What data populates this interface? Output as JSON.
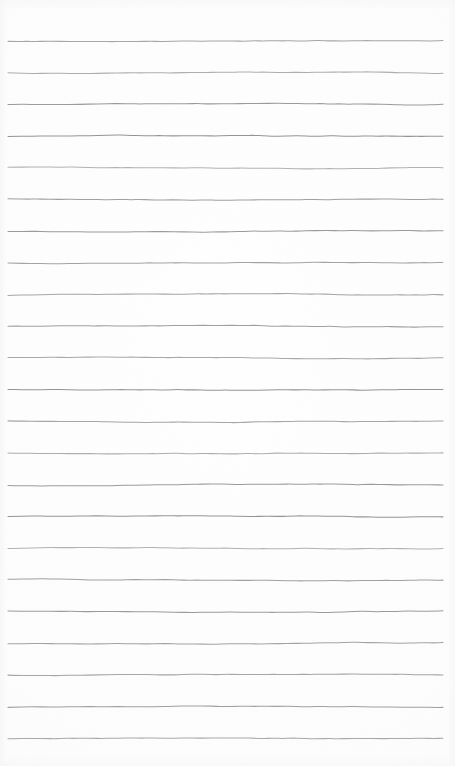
{
  "document": {
    "kind": "lined-notepad-page",
    "title": "",
    "body_text": "",
    "page_number": "",
    "is_blank": true
  },
  "canvas": {
    "width": 455,
    "height": 766,
    "background_color": "#fdfdfd",
    "paper_tint": "#fefefe"
  },
  "ruling": {
    "line_color": "#8a8d90",
    "line_color_light": "#9a9da0",
    "line_width": 1.05,
    "line_count": 23,
    "first_line_y": 41,
    "line_spacing": 31.7,
    "line_start_x": 8,
    "line_end_x": 443,
    "style": "wavy-hand-scanned",
    "waviness_amplitude": 1.3,
    "lines_y": [
      41,
      72.7,
      104.4,
      136.1,
      167.8,
      199.5,
      231.2,
      262.9,
      294.6,
      326.3,
      358.0,
      389.7,
      421.4,
      453.1,
      484.8,
      516.5,
      548.2,
      579.9,
      611.6,
      643.3,
      675.0,
      706.7,
      738.4
    ],
    "line_ids": [
      "rule-1",
      "rule-2",
      "rule-3",
      "rule-4",
      "rule-5",
      "rule-6",
      "rule-7",
      "rule-8",
      "rule-9",
      "rule-10",
      "rule-11",
      "rule-12",
      "rule-13",
      "rule-14",
      "rule-15",
      "rule-16",
      "rule-17",
      "rule-18",
      "rule-19",
      "rule-20",
      "rule-21",
      "rule-22",
      "rule-23"
    ]
  },
  "margins": {
    "has_vertical_margin_rule": false,
    "top_margin": 41,
    "bottom_margin": 28,
    "left_margin": 8,
    "right_margin": 12
  },
  "grain": {
    "fleck_color": "#f2f2f2",
    "fleck_opacity": 0.5
  }
}
